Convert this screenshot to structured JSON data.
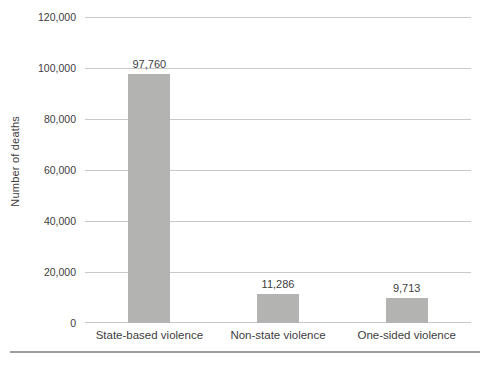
{
  "chart_data": {
    "type": "bar",
    "title": "",
    "categories": [
      "State-based violence",
      "Non-state violence",
      "One-sided violence"
    ],
    "values": [
      97760,
      11286,
      9713
    ],
    "value_labels": [
      "97,760",
      "11,286",
      "9,713"
    ],
    "xlabel": "",
    "ylabel": "Number of deaths",
    "ylim": [
      0,
      120000
    ],
    "yticks": [
      0,
      20000,
      40000,
      60000,
      80000,
      100000,
      120000
    ],
    "ytick_labels": [
      "0",
      "20,000",
      "40,000",
      "60,000",
      "80,000",
      "100,000",
      "120,000"
    ],
    "grid": true,
    "legend": "none",
    "bar_width_px": 42,
    "colors": {
      "bar": "#b3b3b1",
      "gridline": "#c9c9c8",
      "text": "#404040",
      "separator": "#9c9c9c",
      "background": "#ffffff"
    }
  }
}
